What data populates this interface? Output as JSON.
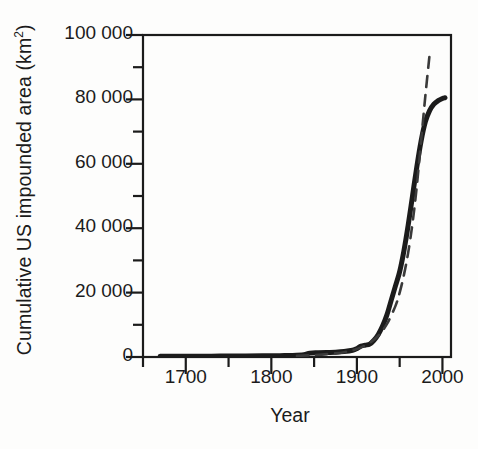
{
  "figure": {
    "background_color": "#fdfdfc",
    "ink_color": "#1b1b1b",
    "axis_label_x": "Year",
    "axis_label_y_text": "Cumulative US impounded area (km",
    "axis_label_y_sup": "2",
    "axis_label_y_tail": ")"
  },
  "chart_data": {
    "type": "line",
    "title": "",
    "subtitle": "",
    "xlabel": "Year",
    "ylabel": "Cumulative US impounded area (km2)",
    "xlim": [
      1650,
      2010
    ],
    "ylim": [
      0,
      100000
    ],
    "grid": false,
    "legend": "none",
    "x_major_ticks": [
      1700,
      1800,
      1900,
      2000
    ],
    "x_minor_ticks": [
      1650,
      1750,
      1850,
      1950
    ],
    "x_tick_labels": [
      "1700",
      "1800",
      "1900",
      "2000"
    ],
    "y_major_ticks": [
      0,
      20000,
      40000,
      60000,
      80000,
      100000
    ],
    "y_minor_ticks": [
      10000,
      30000,
      50000,
      70000,
      90000
    ],
    "y_tick_labels": [
      "0",
      "20 000",
      "40 000",
      "60 000",
      "80 000",
      "100 000"
    ],
    "series": [
      {
        "name": "Cumulative impounded area (observed)",
        "style": "solid",
        "linewidth": 5,
        "color": "#1b1b1b",
        "x": [
          1670,
          1690,
          1710,
          1730,
          1750,
          1770,
          1790,
          1810,
          1825,
          1838,
          1845,
          1855,
          1865,
          1875,
          1885,
          1895,
          1900,
          1905,
          1910,
          1915,
          1920,
          1925,
          1930,
          1935,
          1940,
          1945,
          1950,
          1955,
          1960,
          1965,
          1970,
          1975,
          1980,
          1985,
          1990,
          1995,
          2000,
          2003
        ],
        "values": [
          200,
          220,
          240,
          260,
          290,
          320,
          360,
          420,
          480,
          700,
          1200,
          1300,
          1400,
          1500,
          1700,
          2100,
          2600,
          3400,
          3700,
          4000,
          5200,
          7000,
          9600,
          13000,
          17500,
          22000,
          26500,
          33000,
          41000,
          50000,
          59000,
          67000,
          73000,
          76500,
          78500,
          79600,
          80300,
          80500
        ]
      },
      {
        "name": "Exponential fit",
        "style": "dashed",
        "linewidth": 2.6,
        "color": "#3a3a3a",
        "x": [
          1830,
          1850,
          1870,
          1885,
          1895,
          1905,
          1915,
          1925,
          1935,
          1945,
          1950,
          1955,
          1960,
          1965,
          1970,
          1975,
          1980,
          1985
        ],
        "values": [
          350,
          600,
          1000,
          1500,
          2100,
          3000,
          4400,
          6600,
          10200,
          15800,
          20000,
          25500,
          32500,
          41500,
          53000,
          67000,
          81000,
          94000
        ]
      }
    ],
    "annotations": [
      {
        "text": "dashed exponential fit diverges above observed curve after ~1970"
      }
    ]
  },
  "ticks_y": [
    {
      "label": "0",
      "value": 0
    },
    {
      "label": "20 000",
      "value": 20000
    },
    {
      "label": "40 000",
      "value": 40000
    },
    {
      "label": "60 000",
      "value": 60000
    },
    {
      "label": "80 000",
      "value": 80000
    },
    {
      "label": "100 000",
      "value": 100000
    }
  ],
  "ticks_x": [
    {
      "label": "1700",
      "value": 1700
    },
    {
      "label": "1800",
      "value": 1800
    },
    {
      "label": "1900",
      "value": 1900
    },
    {
      "label": "2000",
      "value": 2000
    }
  ]
}
